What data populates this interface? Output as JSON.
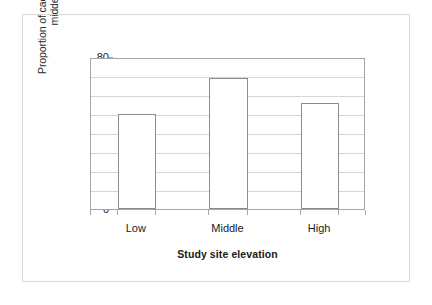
{
  "chart_data": {
    "type": "bar",
    "title": "",
    "subtitle": "",
    "xlabel": "Study site elevation",
    "ylabel": "Proportion of cached cones in\nmiddens",
    "categories": [
      "Low",
      "Middle",
      "High"
    ],
    "values": [
      50,
      69,
      56
    ],
    "series": [
      {
        "name": "Proportion of cached cones in middens",
        "values": [
          50,
          69,
          56
        ]
      }
    ],
    "ylim": [
      0,
      80
    ],
    "y_ticks": [
      0,
      10,
      20,
      30,
      40,
      50,
      60,
      70,
      80
    ],
    "y_tick_labels": [
      "0",
      "10",
      "20",
      "30",
      "40",
      "50",
      "60",
      "70",
      "80"
    ],
    "y_tick_step": 10,
    "grid": "horizontal",
    "legend": "none",
    "bar_fill_color": "#ffffff",
    "bar_border_color": "#8c8c8c",
    "gridline_color": "#d6d6d6",
    "axis_color": "#a6a6a6",
    "text_color": "#1a1a1a",
    "background_color": "#ffffff",
    "frame_border_color": "#d9d9d9",
    "annotations": []
  },
  "figure": {
    "y_axis_title": "Proportion of cached cones in\nmiddens",
    "x_axis_title": "Study site elevation"
  }
}
